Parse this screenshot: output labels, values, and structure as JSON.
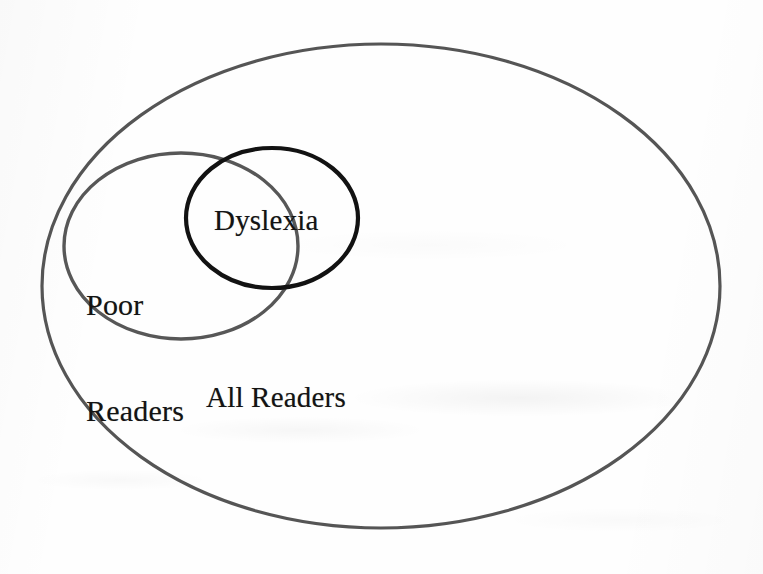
{
  "figure": {
    "type": "venn-diagram",
    "background_color": "#fefefe",
    "title": "",
    "caption": ""
  },
  "sets": [
    {
      "id": "all-readers",
      "label": "All Readers",
      "shape": "ellipse",
      "stroke_color": "#555555",
      "stroke_width": 3.2,
      "fill": "none",
      "center_x": 381,
      "center_y": 286,
      "radius_x": 339,
      "radius_y": 242,
      "rotation": 0,
      "label_x": 285,
      "label_y": 398,
      "contains": [
        "poor-readers",
        "dyslexia"
      ]
    },
    {
      "id": "poor-readers",
      "label": "Poor Readers",
      "label_line_1": "Poor",
      "label_line_2": "Readers",
      "shape": "ellipse",
      "stroke_color": "#575757",
      "stroke_width": 3.4,
      "fill": "none",
      "center_x": 181,
      "center_y": 246,
      "radius_x": 117,
      "radius_y": 93,
      "rotation": 0,
      "label_x": 139,
      "label_y": 255,
      "overlaps": [
        "dyslexia"
      ]
    },
    {
      "id": "dyslexia",
      "label": "Dyslexia",
      "shape": "ellipse",
      "stroke_color": "#121212",
      "stroke_width": 4.2,
      "fill": "none",
      "center_x": 272,
      "center_y": 218,
      "radius_x": 86,
      "radius_y": 70,
      "rotation": 0,
      "label_x": 286,
      "label_y": 222,
      "overlaps": [
        "poor-readers"
      ]
    }
  ],
  "labels": {
    "all_readers": "All Readers",
    "poor": "Poor",
    "readers": "Readers",
    "dyslexia": "Dyslexia"
  }
}
